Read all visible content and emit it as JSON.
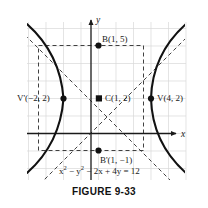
{
  "figure": {
    "caption": "FIGURE 9-33",
    "equation_html": "x<sup>2</sup> &minus; y<sup>2</sup> &minus; 2x + 4y = 12",
    "equation_text": "x2 - y2 - 2x + 4y = 12"
  },
  "axes": {
    "x_label": "x",
    "y_label": "y",
    "x_range": [
      -4,
      6
    ],
    "y_range": [
      -3,
      7
    ],
    "grid": true,
    "grid_color": "#d8d8d8",
    "axis_color": "#1a1a1a"
  },
  "labels": {
    "vertex_left": "V'(−2, 2)",
    "vertex_right": "V(4, 2)",
    "center": "C(1, 2)",
    "b_upper": "B(1, 5)",
    "b_lower": "B'(1, −1)"
  },
  "chart_data": {
    "type": "line",
    "title": "FIGURE 9-33",
    "xlabel": "x",
    "ylabel": "y",
    "xlim": [
      -4,
      6
    ],
    "ylim": [
      -3,
      7
    ],
    "grid": true,
    "curve_equation": "x^2 - y^2 - 2x + 4y = 12",
    "standard_form": "(x-1)^2/9 - (y-2)^2/9 = 1",
    "center": {
      "x": 1,
      "y": 2,
      "marker": "square",
      "label": "C(1, 2)"
    },
    "a": 3,
    "b": 3,
    "vertices": [
      {
        "x": -2,
        "y": 2,
        "marker": "dot",
        "label": "V'(−2, 2)"
      },
      {
        "x": 4,
        "y": 2,
        "marker": "dot",
        "label": "V(4, 2)"
      }
    ],
    "box_points": [
      {
        "x": 1,
        "y": 5,
        "marker": "dot",
        "label": "B(1, 5)"
      },
      {
        "x": 1,
        "y": -1,
        "marker": "dot",
        "label": "B'(1, −1)"
      }
    ],
    "auxiliary_rectangle": {
      "x_min": -2,
      "x_max": 4,
      "y_min": -1,
      "y_max": 5,
      "style": "dashed"
    },
    "asymptotes": [
      {
        "equation": "y = x + 1",
        "slope": 1,
        "intercept": 1,
        "style": "dashed"
      },
      {
        "equation": "y = -x + 3",
        "slope": -1,
        "intercept": 3,
        "style": "dashed"
      }
    ],
    "series": [
      {
        "name": "right branch",
        "style": "solid",
        "color": "#111111"
      },
      {
        "name": "left branch",
        "style": "solid",
        "color": "#111111"
      }
    ]
  }
}
